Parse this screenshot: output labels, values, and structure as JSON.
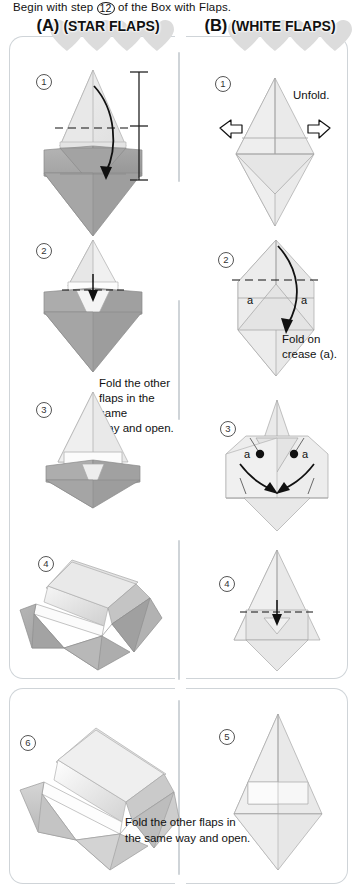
{
  "page": {
    "caption_before": "Begin with step",
    "caption_step": "12",
    "caption_after": "of the Box with Flaps."
  },
  "colors": {
    "paper_light": "#ededed",
    "paper_mid": "#d8d8d8",
    "paper_dark": "#a9a9a9",
    "paper_darker": "#949494",
    "white_face": "#fbfbfb",
    "line": "#8d8d8d",
    "arrow": "#111111",
    "panel_border": "#cfd4d8",
    "heart": "#dcdcdc"
  },
  "panels": [
    {
      "id": "A",
      "letter": "(A)",
      "title": "(STAR FLAPS)",
      "steps": [
        {
          "number": "1",
          "note": ""
        },
        {
          "number": "2",
          "note": ""
        },
        {
          "number": "3",
          "note": "Fold the other\nflaps in the same\nway and open."
        },
        {
          "number": "4",
          "note": ""
        }
      ]
    },
    {
      "id": "B",
      "letter": "(B)",
      "title": "(WHITE FLAPS)",
      "steps": [
        {
          "number": "1",
          "note": "Unfold."
        },
        {
          "number": "2",
          "note": "Fold on\ncrease (a).",
          "labels": [
            "a",
            "a"
          ]
        },
        {
          "number": "3",
          "note": "",
          "labels": [
            "a",
            "a"
          ]
        },
        {
          "number": "4",
          "note": ""
        },
        {
          "number": "5",
          "note": ""
        }
      ]
    }
  ],
  "bottom": {
    "step_number": "6",
    "note_line1": "Fold the other flaps in",
    "note_line2": "the same way and open."
  }
}
